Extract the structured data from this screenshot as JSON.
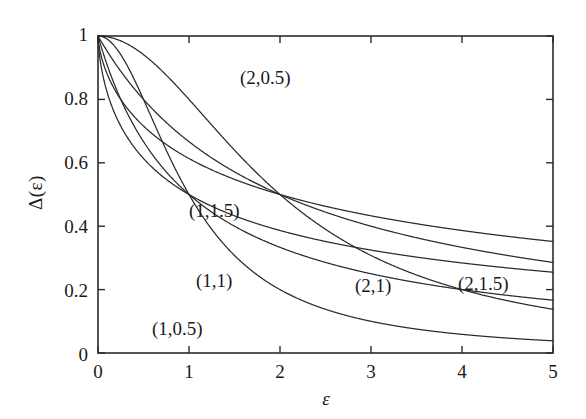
{
  "chart_data": {
    "type": "line",
    "title": "",
    "xlabel": "ε",
    "ylabel": "Δ(ε)",
    "xlim": [
      0,
      5
    ],
    "ylim": [
      0,
      1
    ],
    "grid": false,
    "legend_position": "inline-annotations",
    "xticks": [
      "0",
      "1",
      "2",
      "3",
      "4",
      "5"
    ],
    "xtick_values": [
      0,
      1,
      2,
      3,
      4,
      5
    ],
    "yticks": [
      "0",
      "0.2",
      "0.4",
      "0.6",
      "0.8",
      "1"
    ],
    "ytick_values": [
      0,
      0.2,
      0.4,
      0.6,
      0.8,
      1
    ],
    "line_color": "#2b2b2b",
    "series": [
      {
        "name": "(1,0.5)",
        "params": {
          "a": 1,
          "b": 0.5
        },
        "label": "(1,0.5)",
        "x": [
          0,
          0.1,
          0.2,
          0.3,
          0.4,
          0.5,
          0.6,
          0.7,
          0.8,
          0.9,
          1,
          1.1,
          1.2,
          1.3,
          1.4,
          1.5,
          1.6,
          1.8,
          2,
          2.5,
          3,
          3.5,
          4,
          4.5,
          5
        ],
        "values": [
          1,
          0.99,
          0.961,
          0.925,
          0.862,
          0.8,
          0.735,
          0.672,
          0.61,
          0.552,
          0.5,
          0.452,
          0.41,
          0.372,
          0.338,
          0.308,
          0.281,
          0.236,
          0.2,
          0.138,
          0.1,
          0.076,
          0.059,
          0.047,
          0.038
        ]
      },
      {
        "name": "(1,1)",
        "params": {
          "a": 1,
          "b": 1
        },
        "label": "(1,1)",
        "x": [
          0,
          0.25,
          0.5,
          0.75,
          1,
          1.25,
          1.5,
          1.75,
          2,
          2.25,
          2.5,
          2.75,
          3,
          3.5,
          4,
          4.5,
          5
        ],
        "values": [
          1,
          0.941,
          0.8,
          0.64,
          0.5,
          0.39,
          0.308,
          0.246,
          0.2,
          0.165,
          0.138,
          0.117,
          0.1,
          0.076,
          0.059,
          0.047,
          0.038
        ]
      },
      {
        "name": "(1,1.5)",
        "params": {
          "a": 1,
          "b": 1.5
        },
        "label": "(1,1.5)",
        "x": [
          0,
          0.25,
          0.5,
          0.75,
          1,
          1.5,
          2,
          2.5,
          3,
          3.5,
          4,
          4.5,
          5
        ],
        "values": [
          1,
          0.889,
          0.735,
          0.6,
          0.5,
          0.36,
          0.271,
          0.212,
          0.171,
          0.141,
          0.119,
          0.102,
          0.089
        ]
      },
      {
        "name": "(2,0.5)",
        "params": {
          "a": 2,
          "b": 0.5
        },
        "label": "(2,0.5)",
        "x": [
          0,
          0.25,
          0.5,
          0.75,
          1,
          1.25,
          1.5,
          1.75,
          2,
          2.25,
          2.5,
          2.75,
          3,
          3.5,
          4,
          4.5,
          5
        ],
        "values": [
          1,
          0.999,
          0.996,
          0.986,
          0.969,
          0.937,
          0.888,
          0.818,
          0.5,
          0.245,
          0.17,
          0.122,
          0.09,
          0.052,
          0.032,
          0.021,
          0.015
        ]
      },
      {
        "name": "(2,1)",
        "params": {
          "a": 2,
          "b": 1
        },
        "label": "(2,1)",
        "x": [
          0,
          0.5,
          1,
          1.5,
          2,
          2.5,
          3,
          3.5,
          4,
          4.5,
          5
        ],
        "values": [
          1,
          0.985,
          0.941,
          0.842,
          0.5,
          0.39,
          0.308,
          0.246,
          0.2,
          0.165,
          0.138
        ]
      },
      {
        "name": "(2,1.5)",
        "params": {
          "a": 2,
          "b": 1.5
        },
        "label": "(2,1.5)",
        "x": [
          0,
          0.5,
          1,
          1.5,
          2,
          2.5,
          3,
          3.5,
          4,
          4.5,
          5
        ],
        "values": [
          1,
          0.971,
          0.889,
          0.769,
          0.5,
          0.431,
          0.36,
          0.3,
          0.251,
          0.212,
          0.18
        ]
      }
    ],
    "annotations": [
      {
        "text": "(2,0.5)",
        "x": 2.05,
        "y": 0.845
      },
      {
        "text": "(1,1.5)",
        "x": 1.45,
        "y": 0.465
      },
      {
        "text": "(1,1)",
        "x": 1.47,
        "y": 0.245
      },
      {
        "text": "(1,0.5)",
        "x": 0.97,
        "y": 0.095
      },
      {
        "text": "(2,1)",
        "x": 3.12,
        "y": 0.195
      },
      {
        "text": "(2,1.5)",
        "x": 4.25,
        "y": 0.205
      }
    ]
  }
}
